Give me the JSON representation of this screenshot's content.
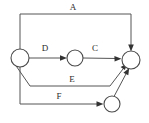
{
  "diagram": {
    "type": "directed-graph",
    "background_color": "#ffffff",
    "stroke_color": "#555555",
    "node_stroke_color": "#4a4a4a",
    "node_fill_color": "#ffffff",
    "label_color": "#2b2b2b",
    "nodes": [
      {
        "id": "n1",
        "label": "",
        "cx": 20,
        "cy": 58,
        "r": 9
      },
      {
        "id": "n2",
        "label": "",
        "cx": 75,
        "cy": 58,
        "r": 8
      },
      {
        "id": "n3",
        "label": "",
        "cx": 131,
        "cy": 60,
        "r": 9
      },
      {
        "id": "n4",
        "label": "",
        "cx": 112,
        "cy": 104,
        "r": 8
      }
    ],
    "edges": [
      {
        "id": "e_a",
        "label": "A",
        "from": "n1",
        "to": "n3",
        "label_x": 73,
        "label_y": 10
      },
      {
        "id": "e_d",
        "label": "D",
        "from": "n1",
        "to": "n2",
        "label_x": 45,
        "label_y": 51
      },
      {
        "id": "e_c",
        "label": "C",
        "from": "n2",
        "to": "n3",
        "label_x": 95,
        "label_y": 51
      },
      {
        "id": "e_e",
        "label": "E",
        "from": "n1",
        "to": "n3",
        "label_x": 72,
        "label_y": 82
      },
      {
        "id": "e_f",
        "label": "F",
        "from": "n1",
        "to": "n4",
        "label_x": 59,
        "label_y": 99
      },
      {
        "id": "e_g",
        "label": "",
        "from": "n4",
        "to": "n3",
        "label_x": 0,
        "label_y": 0
      }
    ]
  }
}
